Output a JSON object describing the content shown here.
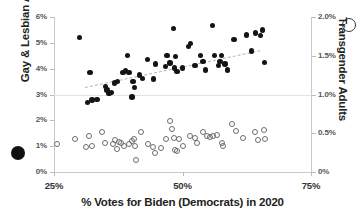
{
  "chart_data": {
    "type": "scatter",
    "title": "",
    "xlabel": "% Votes for Biden (Democrats) in 2020",
    "ylabel": "Gay & Lesbian Adults",
    "y2label": "Transgender Adults",
    "xlim": [
      25,
      75
    ],
    "ylim": [
      0,
      6
    ],
    "y2lim": [
      0,
      2.0
    ],
    "xticks": [
      "25%",
      "50%",
      "75%"
    ],
    "xtick_values": [
      25,
      50,
      75
    ],
    "yticks": [
      "0%",
      "1%",
      "2%",
      "3%",
      "4%",
      "5%",
      "6%"
    ],
    "ytick_values": [
      0,
      1,
      2,
      3,
      4,
      5,
      6
    ],
    "y2ticks": [
      "0%",
      "0.5%",
      "1.0%",
      "1.5%",
      "2.0%"
    ],
    "y2tick_values": [
      0,
      0.5,
      1.0,
      1.5,
      2.0
    ],
    "grid": true,
    "gridlines_y": [
      3
    ],
    "legend_position": "axis-ends",
    "legend": [
      {
        "name": "Gay & Lesbian Adults",
        "marker": "filled-circle",
        "color": "#141414",
        "axis": "left"
      },
      {
        "name": "Transgender Adults",
        "marker": "open-circle",
        "color": "#6d6d6d",
        "axis": "right"
      }
    ],
    "series": [
      {
        "name": "Gay & Lesbian Adults",
        "marker": "filled-circle",
        "axis": "left",
        "points": [
          [
            30.0,
            5.2
          ],
          [
            31.5,
            2.7
          ],
          [
            32.0,
            3.85
          ],
          [
            32.4,
            2.78
          ],
          [
            33.4,
            2.8
          ],
          [
            35.0,
            3.3
          ],
          [
            35.3,
            3.18
          ],
          [
            35.7,
            3.05
          ],
          [
            36.2,
            3.08
          ],
          [
            36.8,
            3.45
          ],
          [
            37.3,
            3.5
          ],
          [
            38.4,
            3.85
          ],
          [
            38.9,
            3.92
          ],
          [
            39.3,
            4.52
          ],
          [
            39.6,
            3.85
          ],
          [
            40.2,
            2.9
          ],
          [
            40.4,
            3.5
          ],
          [
            40.7,
            3.28
          ],
          [
            41.6,
            3.75
          ],
          [
            42.2,
            3.62
          ],
          [
            43.2,
            4.35
          ],
          [
            44.4,
            3.6
          ],
          [
            44.8,
            4.18
          ],
          [
            46.7,
            4.08
          ],
          [
            47.0,
            4.5
          ],
          [
            47.6,
            4.22
          ],
          [
            48.2,
            5.55
          ],
          [
            48.4,
            4.02
          ],
          [
            48.6,
            4.46
          ],
          [
            48.9,
            3.88
          ],
          [
            50.0,
            4.02
          ],
          [
            51.2,
            4.85
          ],
          [
            51.5,
            4.98
          ],
          [
            52.4,
            4.12
          ],
          [
            53.5,
            4.52
          ],
          [
            54.0,
            4.28
          ],
          [
            54.5,
            3.95
          ],
          [
            55.8,
            5.68
          ],
          [
            56.2,
            4.5
          ],
          [
            57.0,
            4.12
          ],
          [
            57.3,
            4.28
          ],
          [
            57.6,
            4.52
          ],
          [
            58.3,
            4.18
          ],
          [
            58.8,
            3.95
          ],
          [
            60.0,
            5.12
          ],
          [
            62.4,
            5.3
          ],
          [
            63.4,
            4.68
          ],
          [
            64.2,
            5.38
          ],
          [
            65.2,
            5.28
          ],
          [
            65.6,
            5.5
          ],
          [
            66.0,
            4.25
          ]
        ]
      },
      {
        "name": "Transgender Adults",
        "marker": "open-circle",
        "axis": "right",
        "points": [
          [
            25.6,
            0.36
          ],
          [
            29.0,
            0.43
          ],
          [
            31.3,
            0.32
          ],
          [
            31.8,
            0.47
          ],
          [
            32.4,
            0.34
          ],
          [
            34.4,
            0.52
          ],
          [
            35.0,
            0.38
          ],
          [
            36.4,
            0.36
          ],
          [
            36.9,
            0.41
          ],
          [
            37.2,
            0.3
          ],
          [
            37.6,
            0.39
          ],
          [
            38.0,
            0.38
          ],
          [
            38.7,
            0.33
          ],
          [
            39.6,
            0.36
          ],
          [
            40.2,
            0.4
          ],
          [
            40.5,
            0.43
          ],
          [
            40.7,
            0.34
          ],
          [
            41.0,
            0.16
          ],
          [
            42.0,
            0.52
          ],
          [
            43.3,
            0.36
          ],
          [
            44.2,
            0.32
          ],
          [
            44.6,
            0.24
          ],
          [
            45.8,
            0.31
          ],
          [
            46.8,
            0.42
          ],
          [
            47.5,
            0.66
          ],
          [
            47.9,
            0.55
          ],
          [
            48.3,
            0.44
          ],
          [
            48.6,
            0.29
          ],
          [
            48.9,
            0.27
          ],
          [
            49.4,
            0.43
          ],
          [
            50.0,
            0.34
          ],
          [
            51.5,
            0.46
          ],
          [
            52.4,
            0.44
          ],
          [
            52.9,
            0.38
          ],
          [
            54.0,
            0.52
          ],
          [
            54.7,
            0.46
          ],
          [
            55.4,
            0.45
          ],
          [
            56.0,
            0.47
          ],
          [
            56.8,
            0.48
          ],
          [
            57.6,
            0.37
          ],
          [
            57.9,
            0.34
          ],
          [
            59.6,
            0.62
          ],
          [
            60.4,
            0.53
          ],
          [
            61.8,
            0.44
          ],
          [
            64.2,
            0.52
          ],
          [
            64.6,
            0.41
          ],
          [
            65.8,
            0.54
          ],
          [
            66.0,
            0.43
          ]
        ]
      }
    ],
    "trendline": {
      "series": "Gay & Lesbian Adults",
      "style": "dashed",
      "color": "#b4b4b4",
      "x_start": 31.0,
      "y_start": 3.3,
      "x_end": 65.0,
      "y_end": 4.72
    }
  },
  "axes": {
    "left_title": "Gay & Lesbian Adults",
    "right_title": "Transgender Adults",
    "x_title": "% Votes for Biden (Democrats) in 2020"
  }
}
